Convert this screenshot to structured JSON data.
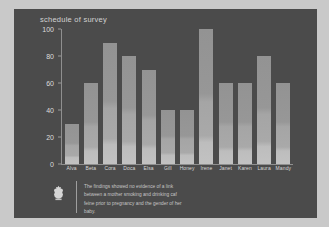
{
  "chart_data": {
    "type": "bar",
    "title": "schedule of survey",
    "xlabel": "",
    "ylabel": "",
    "ylim": [
      0,
      100
    ],
    "yticks": [
      "0",
      "20",
      "40",
      "60",
      "80",
      "100"
    ],
    "grid": false,
    "legend": "none",
    "categories": [
      "Alva",
      "Beta",
      "Cora",
      "Doca",
      "Elsa",
      "Gill",
      "Honey",
      "Irene",
      "Janet",
      "Karen",
      "Laura",
      "Mandy"
    ],
    "values": [
      30,
      60,
      90,
      80,
      70,
      40,
      40,
      100,
      60,
      60,
      80,
      60
    ]
  },
  "footer": {
    "emblem_name": "crest-emblem",
    "caption_lines": [
      "The findings showed no evidence of a link",
      "between a mother smoking and drinking caf",
      "feine prior to pregnancy and the gender of her",
      "baby."
    ]
  },
  "colors": {
    "page_background": "#c9c9c9",
    "panel_background": "#4b4b4b",
    "bar_light": "#c2c2c2",
    "bar_dark": "#939393",
    "axis": "#8f8f8f",
    "text": "#d8d8d8"
  }
}
